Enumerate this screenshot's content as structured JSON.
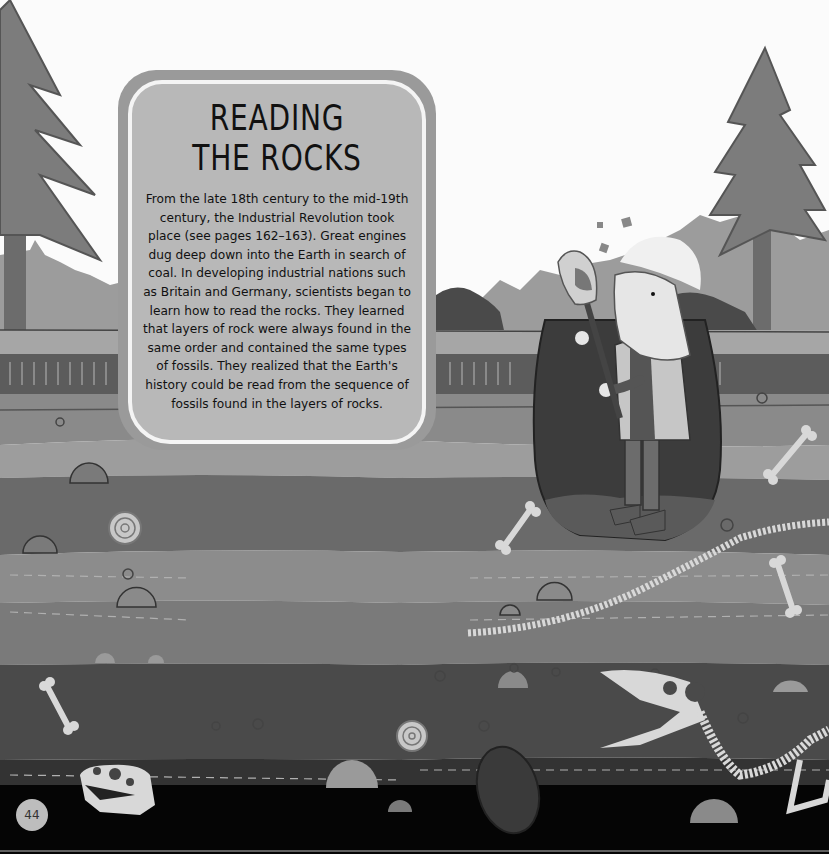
{
  "page": {
    "title_lines": [
      "READING",
      "THE ROCKS"
    ],
    "body_text": "From the late 18th century to the mid-19th century, the Industrial Revolution took place (see pages 162–163). Great engines dug deep down into the Earth in search of coal. In developing industrial nations such as Britain and Germany, scientists began to learn how to read the rocks. They learned that layers of rock were always found in the same order and contained the same types of fossils. They realized that the Earth's history could be read from the sequence of fossils found in the layers of rocks.",
    "page_number": "44"
  },
  "illustration": {
    "scene": "cross-section of rock strata with fossils beneath a forest",
    "elements": [
      "pine-tree",
      "pine-tree",
      "hedge",
      "miner-with-shovel",
      "hard-hat",
      "dig-hole",
      "ammonite-fossil",
      "ammonite-fossil",
      "bone",
      "bone",
      "bone",
      "bone",
      "dinosaur-skull",
      "plesiosaur-skeleton",
      "trilobite-fossil",
      "rocks"
    ],
    "palette": {
      "sky": "#fbfbfb",
      "tree": "#7c7c7c",
      "tree_dark": "#555555",
      "hedge": "#9c9c9c",
      "hedge_dark": "#4a4a4a",
      "grass_band": "#a6a6a6",
      "soil_top": "#5c5c5c",
      "layer_1": "#8a8a8a",
      "layer_2": "#9d9d9d",
      "layer_3": "#6a6a6a",
      "layer_4": "#8c8c8c",
      "layer_5": "#7a7a7a",
      "layer_6": "#4a4a4a",
      "layer_7": "#333333",
      "bedrock": "#050505",
      "fossil": "#d8d8d8",
      "hole": "#3c3c3c"
    }
  }
}
